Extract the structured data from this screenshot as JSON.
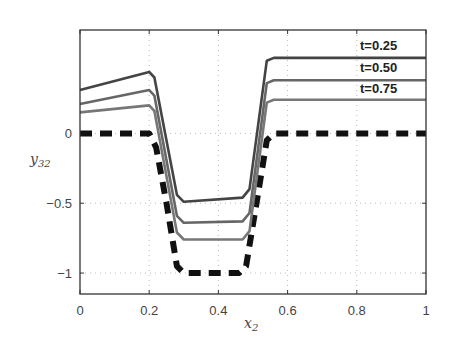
{
  "chart_data": {
    "type": "line",
    "title": "",
    "xlabel": "x_2",
    "ylabel": "y_32",
    "xlim": [
      0,
      1
    ],
    "ylim": [
      -1.15,
      0.74
    ],
    "xticks": [
      0,
      0.2,
      0.4,
      0.6,
      0.8,
      1
    ],
    "xtick_labels": [
      "0",
      "0.2",
      "0.4",
      "0.6",
      "0.8",
      "1"
    ],
    "yticks": [
      0,
      -0.5,
      -1
    ],
    "ytick_labels": [
      "0",
      "-0.5",
      "-1"
    ],
    "grid": true,
    "legend_position": "inline-right",
    "series": [
      {
        "name": "t=0.25",
        "color": "#444444",
        "style": "solid",
        "x": [
          0,
          0.2,
          0.215,
          0.28,
          0.3,
          0.47,
          0.49,
          0.54,
          0.56,
          1
        ],
        "y": [
          0.31,
          0.44,
          0.4,
          -0.44,
          -0.49,
          -0.46,
          -0.4,
          0.52,
          0.54,
          0.54
        ]
      },
      {
        "name": "t=0.50",
        "color": "#666666",
        "style": "solid",
        "x": [
          0,
          0.2,
          0.215,
          0.28,
          0.3,
          0.47,
          0.49,
          0.54,
          0.56,
          1
        ],
        "y": [
          0.21,
          0.31,
          0.27,
          -0.59,
          -0.64,
          -0.63,
          -0.57,
          0.36,
          0.38,
          0.38
        ]
      },
      {
        "name": "t=0.75",
        "color": "#777777",
        "style": "solid",
        "x": [
          0,
          0.2,
          0.215,
          0.28,
          0.3,
          0.47,
          0.49,
          0.54,
          0.56,
          1
        ],
        "y": [
          0.15,
          0.2,
          0.16,
          -0.71,
          -0.76,
          -0.76,
          -0.7,
          0.22,
          0.24,
          0.24
        ]
      },
      {
        "name": "t=0 (initial)",
        "color": "#111111",
        "style": "dash-dot-thick",
        "x": [
          0,
          0.2,
          0.22,
          0.25,
          0.28,
          0.3,
          0.46,
          0.48,
          0.51,
          0.54,
          0.56,
          1
        ],
        "y": [
          0,
          0,
          -0.1,
          -0.5,
          -0.95,
          -1,
          -1,
          -0.95,
          -0.5,
          -0.05,
          0,
          0
        ]
      }
    ]
  },
  "labels": {
    "legend": [
      "t=0.25",
      "t=0.50",
      "t=0.75"
    ],
    "xlabel_main": "x",
    "xlabel_sub": "2",
    "ylabel_main": "y",
    "ylabel_sub": "32"
  }
}
